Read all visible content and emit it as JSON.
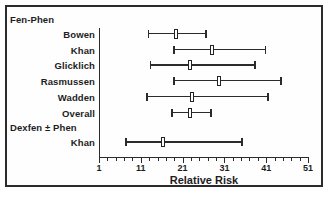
{
  "chart_data": {
    "type": "scatter",
    "plot_style": "forest-plot",
    "title": "",
    "xlabel": "Relative Risk",
    "ylabel": "",
    "xlim": [
      1,
      51
    ],
    "grid": false,
    "legend": false,
    "x_tick_labels": [
      "1",
      "11",
      "21",
      "31",
      "41",
      "51"
    ],
    "x_tick_values": [
      1,
      11,
      21,
      31,
      41,
      51
    ],
    "x_minor_tick_step": 2,
    "groups": [
      {
        "name": "Fen-Phen",
        "rows": [
          {
            "label": "Bowen",
            "estimate": 19.4,
            "ci_low": 12.8,
            "ci_high": 26.6
          },
          {
            "label": "Khan",
            "estimate": 28.0,
            "ci_low": 18.9,
            "ci_high": 40.9
          },
          {
            "label": "Glicklich",
            "estimate": 22.8,
            "ci_low": 13.3,
            "ci_high": 38.3
          },
          {
            "label": "Rasmussen",
            "estimate": 29.7,
            "ci_low": 18.9,
            "ci_high": 44.5
          },
          {
            "label": "Wadden",
            "estimate": 23.3,
            "ci_low": 12.5,
            "ci_high": 41.4
          },
          {
            "label": "Overall",
            "estimate": 22.8,
            "ci_low": 18.5,
            "ci_high": 27.8
          }
        ]
      },
      {
        "name": "Dexfen ± Phen",
        "rows": [
          {
            "label": "Khan",
            "estimate": 16.3,
            "ci_low": 7.5,
            "ci_high": 35.2
          }
        ]
      }
    ]
  },
  "colors": {
    "ink": "#2b2b2b",
    "frame": "#2b2b2b",
    "marker_fill": "#ffffff",
    "background": "#ffffff"
  }
}
